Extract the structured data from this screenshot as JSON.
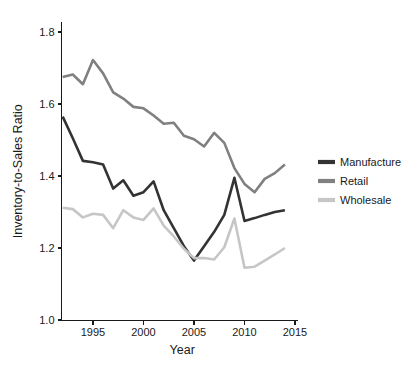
{
  "chart_data": {
    "type": "line",
    "title": "",
    "xlabel": "Year",
    "ylabel": "Inventory-to-Sales Ratio",
    "xlim": [
      1992,
      2015
    ],
    "ylim": [
      1.0,
      1.85
    ],
    "xticks": [
      1995,
      2000,
      2005,
      2010,
      2015
    ],
    "xtick_labels": [
      "1995",
      "2000",
      "2005",
      "2010",
      "2015"
    ],
    "yticks": [
      1.0,
      1.2,
      1.4,
      1.6,
      1.8
    ],
    "ytick_labels": [
      "1.0",
      "1.2",
      "1.4",
      "1.6",
      "1.8"
    ],
    "grid": false,
    "legend_position": "right",
    "x": [
      1992,
      1993,
      1994,
      1995,
      1996,
      1997,
      1998,
      1999,
      2000,
      2001,
      2002,
      2003,
      2004,
      2005,
      2006,
      2007,
      2008,
      2009,
      2010,
      2011,
      2012,
      2013,
      2014
    ],
    "series": [
      {
        "name": "Manufacture",
        "color": "#333333",
        "values": [
          1.565,
          1.505,
          1.442,
          1.438,
          1.432,
          1.365,
          1.388,
          1.345,
          1.355,
          1.385,
          1.305,
          1.255,
          1.205,
          1.165,
          1.205,
          1.245,
          1.292,
          1.395,
          1.275,
          1.283,
          1.292,
          1.3,
          1.305
        ]
      },
      {
        "name": "Retail",
        "color": "#808080",
        "values": [
          1.675,
          1.682,
          1.655,
          1.722,
          1.685,
          1.632,
          1.615,
          1.592,
          1.588,
          1.568,
          1.545,
          1.548,
          1.512,
          1.502,
          1.482,
          1.52,
          1.492,
          1.422,
          1.378,
          1.355,
          1.392,
          1.408,
          1.432
        ]
      },
      {
        "name": "Wholesale",
        "color": "#c6c6c6",
        "values": [
          1.312,
          1.308,
          1.285,
          1.295,
          1.292,
          1.255,
          1.305,
          1.285,
          1.278,
          1.31,
          1.262,
          1.232,
          1.198,
          1.172,
          1.172,
          1.168,
          1.202,
          1.282,
          1.145,
          1.148,
          1.165,
          1.182,
          1.2
        ]
      }
    ]
  },
  "legend": {
    "items": [
      {
        "label": "Manufacture",
        "color": "#333333"
      },
      {
        "label": "Retail",
        "color": "#808080"
      },
      {
        "label": "Wholesale",
        "color": "#c6c6c6"
      }
    ]
  }
}
